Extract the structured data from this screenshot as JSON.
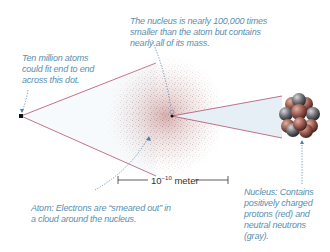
{
  "diagram": {
    "callouts": {
      "nucleus_size": {
        "lines": [
          "The nucleus is nearly 100,000 times",
          "smaller than the atom but contains",
          "nearly all of its mass."
        ]
      },
      "ten_million": {
        "lines": [
          "Ten million atoms",
          "could fit end to end",
          "across this dot."
        ]
      },
      "atom": {
        "lines": [
          "Atom: Electrons are “smeared out” in",
          "a cloud around the nucleus."
        ]
      },
      "nucleus": {
        "lines": [
          "Nucleus: Contains",
          "positively charged",
          "protons (red) and",
          "neutral neutrons",
          "(gray)."
        ]
      }
    },
    "scale_bar": {
      "base": "10",
      "exponent": "−10",
      "unit": "meter"
    },
    "colors": {
      "callout_text": "#5a8fb0",
      "callout_line": "#4a7fa8",
      "wedge_line": "#b0506a",
      "wedge_fill": "#eef4f8",
      "electron_cloud": "#c08a8a",
      "proton": "#9a5a50",
      "neutron": "#6e6e72",
      "dot": "#111111"
    }
  }
}
